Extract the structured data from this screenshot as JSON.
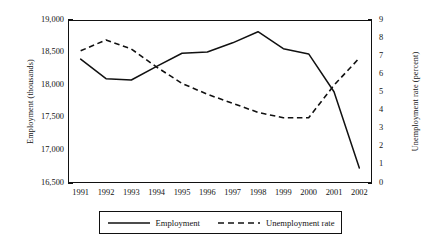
{
  "chart_data": {
    "type": "line",
    "title": "",
    "xlabel": "",
    "ylabel": "Employment (thousands)",
    "y2label": "Unemployment rate (percent)",
    "grid": false,
    "legend_position": "bottom",
    "categories": [
      "1991",
      "1992",
      "1993",
      "1994",
      "1995",
      "1996",
      "1997",
      "1998",
      "1999",
      "2000",
      "2001",
      "2002"
    ],
    "ylim": [
      16500,
      19000
    ],
    "ytick_labels": [
      "16,500",
      "17,000",
      "17,500",
      "18,000",
      "18,500",
      "19,000"
    ],
    "ytick_values": [
      16500,
      17000,
      17500,
      18000,
      18500,
      19000
    ],
    "y2lim": [
      0,
      9
    ],
    "y2tick_labels": [
      "0",
      "1",
      "2",
      "3",
      "4",
      "5",
      "6",
      "7",
      "8",
      "9"
    ],
    "y2tick_values": [
      0,
      1,
      2,
      3,
      4,
      5,
      6,
      7,
      8,
      9
    ],
    "series": [
      {
        "name": "Employment",
        "axis": "left",
        "style": "solid",
        "color": "#111111",
        "values": [
          18400,
          18100,
          18080,
          18290,
          18490,
          18510,
          18650,
          18820,
          18560,
          18480,
          17900,
          16730
        ]
      },
      {
        "name": "Unemployment rate",
        "axis": "right",
        "style": "dashed",
        "color": "#111111",
        "values": [
          7.3,
          7.9,
          7.4,
          6.4,
          5.5,
          4.9,
          4.4,
          3.9,
          3.6,
          3.6,
          5.4,
          6.9
        ]
      }
    ]
  },
  "legend": {
    "entries": [
      {
        "label": "Employment",
        "style": "solid"
      },
      {
        "label": "Unemployment rate",
        "style": "dashed"
      }
    ]
  }
}
